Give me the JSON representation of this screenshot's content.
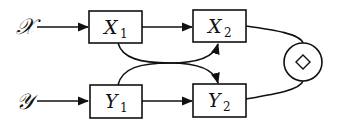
{
  "diagram": {
    "inputs": [
      {
        "id": "x",
        "label": "𝒳"
      },
      {
        "id": "y",
        "label": "𝒴"
      }
    ],
    "nodes": [
      {
        "id": "X1",
        "base": "X",
        "sub": "1"
      },
      {
        "id": "X2",
        "base": "X",
        "sub": "2"
      },
      {
        "id": "Y1",
        "base": "Y",
        "sub": "1"
      },
      {
        "id": "Y2",
        "base": "Y",
        "sub": "2"
      }
    ],
    "combiner": {
      "symbol": "◇"
    },
    "edges": [
      {
        "from": "x",
        "to": "X1"
      },
      {
        "from": "y",
        "to": "Y1"
      },
      {
        "from": "X1",
        "to": "X2"
      },
      {
        "from": "Y1",
        "to": "Y2"
      },
      {
        "from": "X1",
        "to": "Y2",
        "merged_with": "Y1"
      },
      {
        "from": "Y1",
        "to": "X2",
        "merged_with": "X1"
      },
      {
        "from": "X2",
        "to": "combiner"
      },
      {
        "from": "Y2",
        "to": "combiner"
      }
    ]
  }
}
